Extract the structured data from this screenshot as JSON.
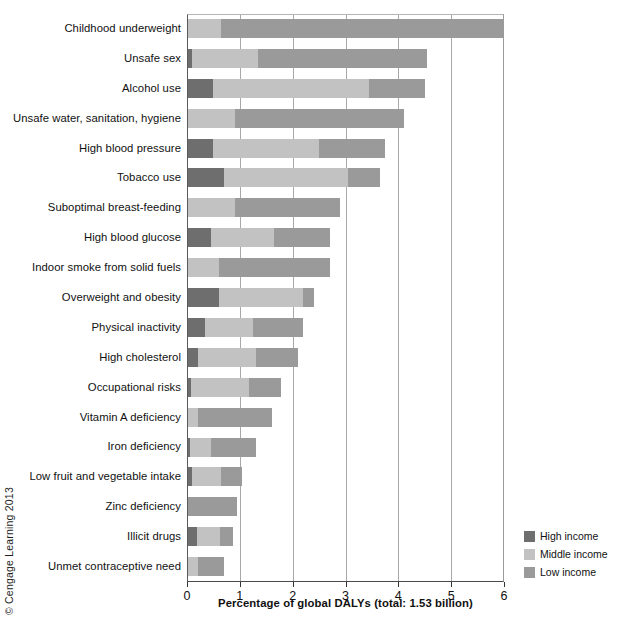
{
  "copyright": "© Cengage Learning 2013",
  "legend": {
    "position": "bottom-right",
    "items": [
      {
        "label": "High income",
        "color": "#6e6e6e"
      },
      {
        "label": "Middle income",
        "color": "#c2c2c2"
      },
      {
        "label": "Low income",
        "color": "#9a9a9a"
      }
    ]
  },
  "axis": {
    "x_title": "Percentage of global DALYs (total: 1.53 billion)",
    "x_ticks": [
      "0",
      "1",
      "2",
      "3",
      "4",
      "5",
      "6"
    ],
    "x_min": 0,
    "x_max": 6
  },
  "chart_data": {
    "type": "bar",
    "orientation": "horizontal",
    "stacked": true,
    "title": "",
    "subtitle": "",
    "xlabel": "Percentage of global DALYs (total: 1.53 billion)",
    "ylabel": "",
    "xlim": [
      0,
      6
    ],
    "xticks": [
      0,
      1,
      2,
      3,
      4,
      5,
      6
    ],
    "grid": "vertical",
    "legend_position": "bottom-right",
    "categories": [
      "Childhood underweight",
      "Unsafe sex",
      "Alcohol use",
      "Unsafe water, sanitation, hygiene",
      "High blood pressure",
      "Tobacco use",
      "Suboptimal breast-feeding",
      "High blood glucose",
      "Indoor smoke from solid fuels",
      "Overweight and obesity",
      "Physical inactivity",
      "High cholesterol",
      "Occupational risks",
      "Vitamin A deficiency",
      "Iron deficiency",
      "Low fruit and vegetable intake",
      "Zinc deficiency",
      "Illicit drugs",
      "Unmet contraceptive need"
    ],
    "series": [
      {
        "name": "High income",
        "color": "#6e6e6e",
        "values": [
          0.0,
          0.1,
          0.5,
          0.0,
          0.5,
          0.7,
          0.0,
          0.45,
          0.0,
          0.6,
          0.35,
          0.2,
          0.08,
          0.0,
          0.05,
          0.1,
          0.0,
          0.18,
          0.0
        ]
      },
      {
        "name": "Middle income",
        "color": "#c2c2c2",
        "values": [
          0.65,
          1.25,
          2.95,
          0.9,
          2.0,
          2.35,
          0.9,
          1.2,
          0.6,
          1.6,
          0.9,
          1.1,
          1.1,
          0.2,
          0.4,
          0.55,
          0.0,
          0.45,
          0.2
        ]
      },
      {
        "name": "Low income",
        "color": "#9a9a9a",
        "values": [
          5.35,
          3.2,
          1.05,
          3.2,
          1.25,
          0.6,
          2.0,
          1.05,
          2.1,
          0.2,
          0.95,
          0.8,
          0.6,
          1.4,
          0.85,
          0.4,
          0.95,
          0.25,
          0.5
        ]
      }
    ],
    "totals": [
      6.0,
      4.55,
      4.5,
      4.1,
      3.75,
      3.65,
      2.9,
      2.7,
      2.7,
      2.4,
      2.2,
      2.1,
      1.78,
      1.6,
      1.3,
      1.05,
      0.95,
      0.88,
      0.7
    ]
  }
}
